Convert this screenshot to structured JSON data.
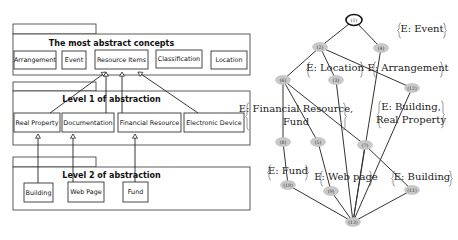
{
  "uml": {
    "packages": [
      {
        "title": "The most abstract concepts",
        "tab": {
          "x": 13,
          "y": 24,
          "w": 83,
          "h": 10
        },
        "body": {
          "x": 13,
          "y": 34,
          "w": 237,
          "h": 41
        },
        "title_y": 46,
        "classes": [
          {
            "label": "Arrangement",
            "x": 14,
            "y": 51,
            "w": 42,
            "h": 18
          },
          {
            "label": "Event",
            "x": 62,
            "y": 51,
            "w": 24,
            "h": 18
          },
          {
            "label": "Resource Items",
            "x": 95,
            "y": 50,
            "w": 53,
            "h": 19
          },
          {
            "label": "Classification",
            "x": 156,
            "y": 50,
            "w": 46,
            "h": 18
          },
          {
            "label": "Location",
            "x": 211,
            "y": 51,
            "w": 36,
            "h": 18
          }
        ]
      },
      {
        "title": "Level 1 of abstraction",
        "tab": {
          "x": 13,
          "y": 82,
          "w": 83,
          "h": 9
        },
        "body": {
          "x": 13,
          "y": 91,
          "w": 237,
          "h": 54
        },
        "title_y": 102,
        "classes": [
          {
            "label": "Real Property",
            "x": 14,
            "y": 113,
            "w": 46,
            "h": 19
          },
          {
            "label": "Documentation",
            "x": 62,
            "y": 113,
            "w": 52,
            "h": 19
          },
          {
            "label": "Financial Resource",
            "x": 118,
            "y": 113,
            "w": 63,
            "h": 19
          },
          {
            "label": "Electronic Device",
            "x": 184,
            "y": 113,
            "w": 60,
            "h": 19
          }
        ]
      },
      {
        "title": "Level 2 of abstraction",
        "tab": {
          "x": 13,
          "y": 157,
          "w": 83,
          "h": 10
        },
        "body": {
          "x": 13,
          "y": 167,
          "w": 237,
          "h": 43
        },
        "title_y": 178,
        "classes": [
          {
            "label": "Building",
            "x": 24,
            "y": 183,
            "w": 29,
            "h": 19
          },
          {
            "label": "Web Page",
            "x": 68,
            "y": 182,
            "w": 36,
            "h": 20
          },
          {
            "label": "Fund",
            "x": 123,
            "y": 182,
            "w": 25,
            "h": 20
          }
        ]
      }
    ],
    "generalizations": [
      {
        "from": "Real Property",
        "x1": 50,
        "y1": 113,
        "x2": 106,
        "y2": 72
      },
      {
        "from": "Documentation",
        "x1": 106,
        "y1": 113,
        "x2": 106,
        "y2": 72
      },
      {
        "from": "Financial Resource",
        "x1": 122,
        "y1": 113,
        "x2": 122,
        "y2": 72
      },
      {
        "from": "Electronic Device",
        "x1": 198,
        "y1": 113,
        "x2": 138,
        "y2": 72
      },
      {
        "from": "Building",
        "x1": 38,
        "y1": 183,
        "x2": 38,
        "y2": 134
      },
      {
        "from": "Web Page",
        "x1": 73,
        "y1": 182,
        "x2": 73,
        "y2": 134
      },
      {
        "from": "Fund",
        "x1": 135,
        "y1": 182,
        "x2": 135,
        "y2": 134
      }
    ]
  },
  "lattice": {
    "nodes": [
      {
        "id": "1",
        "label": "(1)",
        "x": 354,
        "y": 20,
        "top": true
      },
      {
        "id": "2",
        "label": "(2)",
        "x": 320,
        "y": 47
      },
      {
        "id": "4",
        "label": "(4)",
        "x": 381,
        "y": 48
      },
      {
        "id": "6",
        "label": "(6)",
        "x": 283,
        "y": 80
      },
      {
        "id": "3",
        "label": "(3)",
        "x": 336,
        "y": 80
      },
      {
        "id": "12",
        "label": "(12)",
        "x": 412,
        "y": 88
      },
      {
        "id": "8",
        "label": "(8)",
        "x": 283,
        "y": 142
      },
      {
        "id": "5",
        "label": "(5)",
        "x": 318,
        "y": 142
      },
      {
        "id": "7",
        "label": "(7)",
        "x": 365,
        "y": 145
      },
      {
        "id": "10",
        "label": "(10)",
        "x": 288,
        "y": 185
      },
      {
        "id": "9",
        "label": "(9)",
        "x": 331,
        "y": 191
      },
      {
        "id": "11",
        "label": "(11)",
        "x": 412,
        "y": 190
      },
      {
        "id": "13",
        "label": "(13)",
        "x": 353,
        "y": 222
      }
    ],
    "edges": [
      [
        "1",
        "2"
      ],
      [
        "1",
        "4"
      ],
      [
        "2",
        "6"
      ],
      [
        "2",
        "3"
      ],
      [
        "2",
        "12"
      ],
      [
        "6",
        "8"
      ],
      [
        "6",
        "5"
      ],
      [
        "6",
        "7"
      ],
      [
        "7",
        "11"
      ],
      [
        "8",
        "10"
      ],
      [
        "5",
        "9"
      ],
      [
        "3",
        "13"
      ],
      [
        "4",
        "13"
      ],
      [
        "12",
        "13"
      ],
      [
        "7",
        "13"
      ],
      [
        "10",
        "13"
      ],
      [
        "9",
        "13"
      ],
      [
        "11",
        "13"
      ]
    ],
    "annotations": [
      {
        "lines": [
          "E: Event"
        ],
        "x": 398,
        "y": 32,
        "w": 48
      },
      {
        "lines": [
          "E: Location"
        ],
        "x": 307,
        "y": 71,
        "w": 56
      },
      {
        "lines": [
          "E: Arrangement"
        ],
        "x": 373,
        "y": 71,
        "w": 70
      },
      {
        "lines": [
          "E: Financial Resource,",
          "Fund"
        ],
        "x": 246,
        "y": 112,
        "w": 100,
        "prefix_left": true
      },
      {
        "lines": [
          "E: Building,",
          "Real Property"
        ],
        "x": 378,
        "y": 110,
        "w": 66
      },
      {
        "lines": [
          "E: Fund"
        ],
        "x": 268,
        "y": 174,
        "w": 40
      },
      {
        "lines": [
          "E: Web page"
        ],
        "x": 320,
        "y": 180,
        "w": 52
      },
      {
        "lines": [
          "E: Building"
        ],
        "x": 392,
        "y": 180,
        "w": 60
      }
    ]
  }
}
